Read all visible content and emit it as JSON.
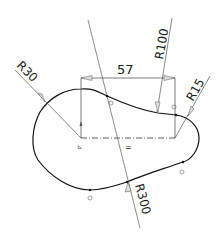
{
  "sketch": {
    "dimensions": {
      "linear": {
        "label": "57"
      },
      "radius_left": {
        "label": "R30"
      },
      "radius_top": {
        "label": "R100"
      },
      "radius_right": {
        "label": "R15"
      },
      "radius_bottom": {
        "label": "R300"
      }
    },
    "relations": {
      "horizontal": {
        "label": "="
      }
    },
    "colors": {
      "line": "#111111",
      "leader": "#444444",
      "arrow": "#d8d8d8",
      "relation": "#666666"
    }
  }
}
